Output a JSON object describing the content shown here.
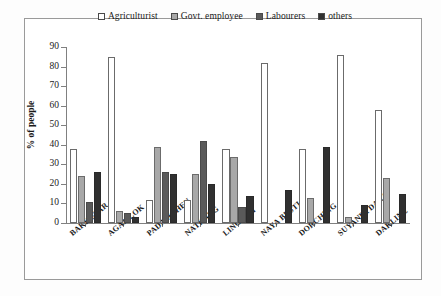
{
  "chart_data": {
    "type": "bar",
    "title": "",
    "subtitle": "",
    "xlabel": "",
    "ylabel": "% of people",
    "ylim": [
      0,
      90
    ],
    "ytick_step": 10,
    "yticks": [
      0,
      10,
      20,
      30,
      40,
      50,
      60,
      70,
      80,
      90
    ],
    "ytick_labels": [
      "0",
      "10",
      "20",
      "30",
      "40",
      "50",
      "60",
      "70",
      "80",
      "90"
    ],
    "grid": false,
    "legend_position": "top-center",
    "categories": [
      "BAKHUTAR",
      "AGAMLOK",
      "PADAMCHEN",
      "NATHANG",
      "LINGTAM",
      "NAYA BUSTI",
      "DORCHING",
      "SUYANEYDARA",
      "DAKLINE"
    ],
    "series": [
      {
        "name": "Agriculturist",
        "color": "#ffffff",
        "values": [
          38,
          85,
          12,
          12,
          38,
          82,
          38,
          86,
          58
        ]
      },
      {
        "name": "Govt. employee",
        "color": "#a8a8a8",
        "values": [
          24,
          6,
          39,
          25,
          34,
          0,
          13,
          3,
          23
        ]
      },
      {
        "name": "Labourers",
        "color": "#5a5a5a",
        "values": [
          11,
          5,
          26,
          42,
          8,
          0,
          0,
          0,
          0
        ]
      },
      {
        "name": "others",
        "color": "#303030",
        "values": [
          26,
          3,
          25,
          20,
          14,
          17,
          39,
          9,
          15
        ]
      }
    ]
  },
  "legend": {
    "entries": [
      {
        "label": "Agriculturist"
      },
      {
        "label": "Govt. employee"
      },
      {
        "label": "Labourers"
      },
      {
        "label": "others"
      }
    ]
  },
  "axes": {
    "y_title": "% of people"
  }
}
